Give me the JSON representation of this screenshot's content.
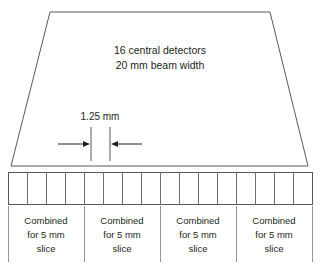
{
  "figure": {
    "background_color": "#ffffff",
    "line_color": "#58595b",
    "text_color": "#231f20"
  },
  "beam": {
    "label_line1": "16 central detectors",
    "label_line2": "20 mm beam width",
    "detector_count": 16,
    "beam_width_mm": 20,
    "shape": "trapezoid"
  },
  "dimension": {
    "label": "1.25 mm",
    "value_mm": 1.25,
    "arrow_left_name": "arrow-right-pointing",
    "arrow_right_name": "arrow-left-pointing"
  },
  "detectors": {
    "cell_count": 16,
    "cells": [
      {
        "index": 1
      },
      {
        "index": 2
      },
      {
        "index": 3
      },
      {
        "index": 4
      },
      {
        "index": 5
      },
      {
        "index": 6
      },
      {
        "index": 7
      },
      {
        "index": 8
      },
      {
        "index": 9
      },
      {
        "index": 10
      },
      {
        "index": 11
      },
      {
        "index": 12
      },
      {
        "index": 13
      },
      {
        "index": 14
      },
      {
        "index": 15
      },
      {
        "index": 16
      }
    ]
  },
  "groups": [
    {
      "index": 1,
      "line1": "Combined",
      "line2": "for 5 mm",
      "line3": "slice",
      "slice_thickness_mm": 5,
      "detector_count": 4
    },
    {
      "index": 2,
      "line1": "Combined",
      "line2": "for 5 mm",
      "line3": "slice",
      "slice_thickness_mm": 5,
      "detector_count": 4
    },
    {
      "index": 3,
      "line1": "Combined",
      "line2": "for 5 mm",
      "line3": "slice",
      "slice_thickness_mm": 5,
      "detector_count": 4
    },
    {
      "index": 4,
      "line1": "Combined",
      "line2": "for 5 mm",
      "line3": "slice",
      "slice_thickness_mm": 5,
      "detector_count": 4
    }
  ]
}
